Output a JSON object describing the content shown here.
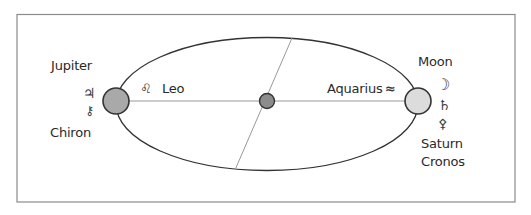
{
  "diagram": {
    "type": "orbital-axis-diagram",
    "left_point": {
      "labels": [
        "Jupiter",
        "Chiron"
      ],
      "symbols": [
        {
          "name": "jupiter-symbol",
          "glyph": "♃"
        },
        {
          "name": "chiron-symbol",
          "glyph": "⚷"
        }
      ],
      "fill": "#a9a9a9"
    },
    "right_point": {
      "labels": [
        "Moon",
        "Saturn",
        "Cronos"
      ],
      "symbols": [
        {
          "name": "moon-symbol",
          "glyph": "☽"
        },
        {
          "name": "saturn-symbol",
          "glyph": "♄"
        },
        {
          "name": "cronos-symbol",
          "glyph": "⚴"
        }
      ],
      "fill": "#dcdcdc"
    },
    "center_point": {
      "fill": "#8c8c8c"
    },
    "axis_labels": {
      "left": {
        "text": "Leo",
        "symbol": "♌"
      },
      "right": {
        "text": "Aquarius",
        "symbol": "≈"
      }
    },
    "colors": {
      "stroke": "#333333",
      "axis_line": "#999999",
      "frame": "#8a8a8a"
    }
  }
}
